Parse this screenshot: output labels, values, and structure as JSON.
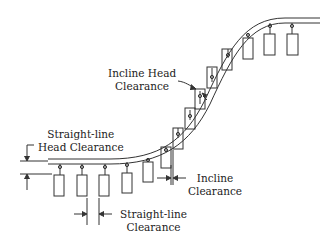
{
  "diagram": {
    "colors": {
      "line": "#333333",
      "background": "#ffffff"
    },
    "labels": {
      "incline_head": {
        "line1": "Incline Head",
        "line2": "Clearance"
      },
      "straight_head": {
        "line1": "Straight-line",
        "line2": "Head Clearance"
      },
      "incline": {
        "line1": "Incline",
        "line2": "Clearance"
      },
      "straight": {
        "line1": "Straight-line",
        "line2": "Clearance"
      }
    },
    "carrier_count": 13
  }
}
